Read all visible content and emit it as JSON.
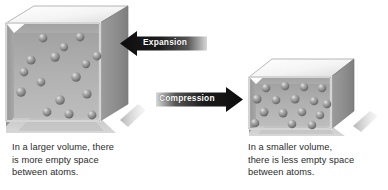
{
  "figure": {
    "background_color": "#ffffff"
  },
  "left_box": {
    "name": "large-volume-box",
    "caption": "In a larger volume, there\nis more empty space\nbetween atoms.",
    "atom_count": 16,
    "top_face_color": "#f2f2f2",
    "front_face_color": "#b8b8b8",
    "side_face_color": "#8f8f8f",
    "atom_color": "#8a8a8a"
  },
  "right_box": {
    "name": "small-volume-box",
    "caption": "In a smaller volume,\nthere is less empty space\nbetween atoms.",
    "atom_count": 16,
    "top_face_color": "#f2f2f2",
    "front_face_color": "#b8b8b8",
    "side_face_color": "#8f8f8f",
    "atom_color": "#8a8a8a"
  },
  "arrows": {
    "expansion": {
      "label": "Expansion",
      "direction": "left",
      "bar_color": "#1a1a1a",
      "text_color": "#ffffff"
    },
    "compression": {
      "label": "Compression",
      "direction": "right",
      "bar_color": "#1a1a1a",
      "text_color": "#ffffff"
    }
  }
}
